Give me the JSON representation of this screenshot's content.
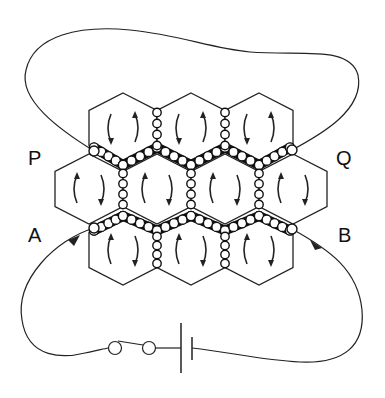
{
  "diagram": {
    "type": "circuit-with-hexagonal-cell-lattice",
    "labels": {
      "P": "P",
      "Q": "Q",
      "A": "A",
      "B": "B"
    },
    "colors": {
      "line": "#222222",
      "background": "#ffffff",
      "chain_fill": "#111111",
      "bead_fill": "#ffffff"
    },
    "hex_grid": {
      "rows": [
        {
          "name": "top",
          "count": 3,
          "center_y": 128,
          "centers_x": [
            123,
            191,
            259
          ],
          "arrow_direction": "clockwise"
        },
        {
          "name": "middle",
          "count": 4,
          "center_y": 189,
          "centers_x": [
            89,
            157,
            225,
            293
          ],
          "arrow_direction": "counter-clockwise"
        },
        {
          "name": "bottom",
          "count": 3,
          "center_y": 250,
          "centers_x": [
            123,
            191,
            259
          ],
          "arrow_direction": "counter-clockwise"
        }
      ],
      "half_width": 34,
      "half_height": 35
    },
    "components": {
      "switch": "two-terminal switch",
      "battery": "single cell battery"
    },
    "arrows": {
      "A": "current in",
      "B": "current out"
    }
  }
}
